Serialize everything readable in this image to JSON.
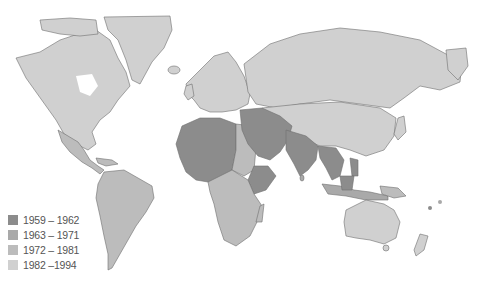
{
  "map": {
    "type": "choropleth-world-map",
    "projection": "equirectangular-ish",
    "colors": {
      "ocean": "#ffffff",
      "border": "#6f6f6f",
      "class_1959_1962": "#8c8c8c",
      "class_1963_1971": "#a9a9a9",
      "class_1972_1981": "#bcbcbc",
      "class_1982_1994": "#d0d0d0"
    }
  },
  "legend": {
    "items": [
      {
        "label": "1959 – 1962",
        "color": "#8c8c8c"
      },
      {
        "label": "1963 – 1971",
        "color": "#a9a9a9"
      },
      {
        "label": "1972 – 1981",
        "color": "#bcbcbc"
      },
      {
        "label": "1982 –1994",
        "color": "#d0d0d0"
      }
    ]
  }
}
